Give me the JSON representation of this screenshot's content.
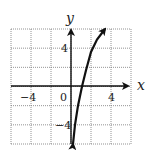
{
  "chart_data": {
    "type": "line",
    "title": "",
    "xlabel": "x",
    "ylabel": "y",
    "xlim": [
      -6,
      6
    ],
    "ylim": [
      -6,
      6
    ],
    "grid": true,
    "grid_step": 2,
    "x_tick_labels": [
      "-4",
      "0",
      "4"
    ],
    "y_tick_labels": [
      "4",
      "-4"
    ],
    "series": [
      {
        "name": "curve",
        "x": [
          0.2,
          0.4,
          0.7,
          1.1,
          1.5,
          2.0,
          2.6,
          3.4
        ],
        "y": [
          -6,
          -4,
          -2,
          0,
          1.7,
          3.6,
          4.9,
          6
        ],
        "arrows_both_ends": true
      }
    ],
    "labels": {
      "x_axis": "x",
      "y_axis": "y",
      "tick_neg4_x": "−4",
      "tick_0": "0",
      "tick_4_x": "4",
      "tick_4_y": "4",
      "tick_neg4_y": "−4"
    }
  }
}
